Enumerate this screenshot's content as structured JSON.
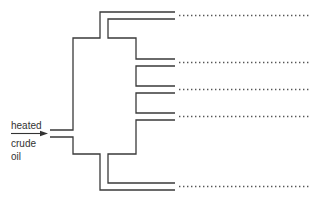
{
  "diagram": {
    "type": "fractionating-column-schematic",
    "input": {
      "label_lines": [
        "heated",
        "crude",
        "oil"
      ],
      "arrow": "right-arrow"
    },
    "outlets": [
      {
        "index": 1,
        "position": "top",
        "label": "........................"
      },
      {
        "index": 2,
        "position": "upper-middle",
        "label": "........................"
      },
      {
        "index": 3,
        "position": "middle",
        "label": "........................"
      },
      {
        "index": 4,
        "position": "lower-middle",
        "label": "........................"
      },
      {
        "index": 5,
        "position": "bottom",
        "label": "........................"
      }
    ],
    "colors": {
      "line": "#3a3a3a",
      "dots": "#555555",
      "background": "#ffffff"
    }
  }
}
